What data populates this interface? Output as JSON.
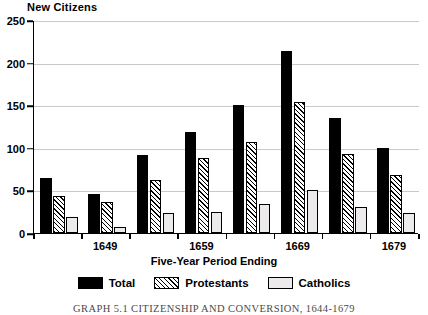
{
  "chart_data": {
    "type": "bar",
    "title": "New Citizens",
    "subtitle": "",
    "xlabel": "Five-Year Period Ending",
    "ylabel": "",
    "ylim": [
      0,
      250
    ],
    "ytick_step": 50,
    "yticks": [
      0,
      50,
      100,
      150,
      200,
      250
    ],
    "ytick_labels": [
      "0",
      "50",
      "100",
      "150",
      "200",
      "250"
    ],
    "grid": true,
    "legend_position": "bottom",
    "categories": [
      "1644",
      "1649",
      "1654",
      "1659",
      "1664",
      "1669",
      "1674",
      "1679"
    ],
    "visible_tick_labels": [
      "1649",
      "1659",
      "1669",
      "1679"
    ],
    "series": [
      {
        "name": "Total",
        "color": "#000000",
        "pattern": "solid",
        "values": [
          65,
          46,
          91,
          119,
          150,
          214,
          135,
          100
        ]
      },
      {
        "name": "Protestants",
        "color": "#000000",
        "pattern": "hatch",
        "values": [
          43,
          36,
          62,
          88,
          107,
          154,
          93,
          68
        ]
      },
      {
        "name": "Catholics",
        "color": "#eceaea",
        "pattern": "light",
        "values": [
          19,
          7,
          23,
          25,
          34,
          50,
          31,
          24
        ]
      }
    ],
    "caption": "GRAPH 5.1   CITIZENSHIP AND CONVERSION, 1644-1679"
  },
  "legend": {
    "items": [
      {
        "label": "Total"
      },
      {
        "label": "Protestants"
      },
      {
        "label": "Catholics"
      }
    ]
  }
}
